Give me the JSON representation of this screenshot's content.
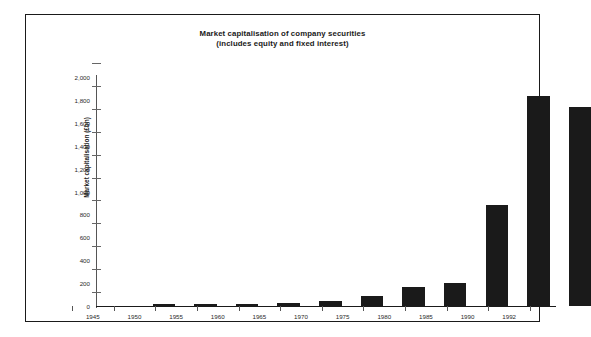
{
  "chart_data": {
    "type": "bar",
    "title": "Market capitalisation of company securities",
    "subtitle": "(includes equity and fixed interest)",
    "xlabel": "",
    "ylabel": "Market capitalisation (£bn)",
    "categories": [
      "1945",
      "1950",
      "1955",
      "1960",
      "1965",
      "1970",
      "1975",
      "1980",
      "1985",
      "1990",
      "1992"
    ],
    "values": [
      5,
      8,
      12,
      25,
      40,
      90,
      170,
      200,
      880,
      1830,
      1740
    ],
    "ylim": [
      0,
      2000
    ],
    "ytick_step": 200,
    "ytick_labels": [
      "0",
      "200",
      "400",
      "600",
      "800",
      "1,000",
      "1,200",
      "1,400",
      "1,600",
      "1,800",
      "2,000"
    ],
    "grid": false,
    "legend": null,
    "bar_color": "#1a1a1a",
    "background_color": "#ffffff",
    "border_color": "#1a1a1a"
  }
}
